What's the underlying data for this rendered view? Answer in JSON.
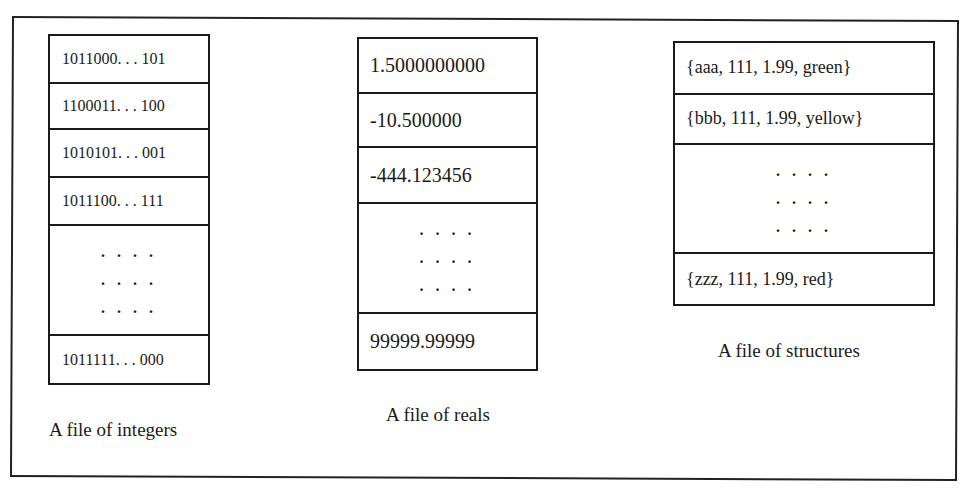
{
  "diagram": {
    "type": "file-record-illustration",
    "files": [
      {
        "id": "integers",
        "caption": "A file of integers",
        "records": [
          "1011000. . . 101",
          "1100011. . . 100",
          "1010101. . . 001",
          "1011100. . . 111"
        ],
        "ellipsis_rows": [
          ". . . .",
          ". . . .",
          ". . . ."
        ],
        "last_record": "1011111. . . 000"
      },
      {
        "id": "reals",
        "caption": "A file of reals",
        "records": [
          "1.5000000000",
          "-10.500000",
          "-444.123456"
        ],
        "ellipsis_rows": [
          ". . . .",
          ". . . .",
          ". . . ."
        ],
        "last_record": "99999.99999"
      },
      {
        "id": "structures",
        "caption": "A file of structures",
        "records": [
          "{aaa, 111, 1.99,  green}",
          "{bbb, 111, 1.99,  yellow}"
        ],
        "ellipsis_rows": [
          ". . . .",
          ". . . .",
          ". . . ."
        ],
        "last_record": "{zzz, 111, 1.99,  red}"
      }
    ]
  }
}
